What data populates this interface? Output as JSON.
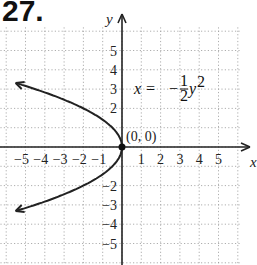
{
  "problem_number": "27.",
  "chart_data": {
    "type": "line",
    "title": "",
    "equation": "x = -½y²",
    "equation_parts": {
      "lhs": "x =",
      "sign": "−",
      "num": "1",
      "den": "2",
      "var": "y",
      "exp": "2"
    },
    "xlabel": "x",
    "ylabel": "y",
    "xlim": [
      -6,
      6
    ],
    "ylim": [
      -6,
      6
    ],
    "grid": true,
    "x_ticks": [
      "-5",
      "-4",
      "-3",
      "-2",
      "-1",
      "1",
      "2",
      "3",
      "4",
      "5"
    ],
    "y_ticks": [
      "5",
      "4",
      "3",
      "2",
      "-2",
      "-3",
      "-4",
      "-5"
    ],
    "annotations": [
      {
        "text": "(0, 0)",
        "x": 0,
        "y": 0,
        "point": true
      }
    ],
    "series": [
      {
        "name": "x = -1/2 y^2",
        "points": [
          [
            -5.5,
            3.32
          ],
          [
            -4.5,
            3
          ],
          [
            -2,
            2
          ],
          [
            -0.5,
            1
          ],
          [
            0,
            0
          ],
          [
            -0.5,
            -1
          ],
          [
            -2,
            -2
          ],
          [
            -4.5,
            -3
          ],
          [
            -5.5,
            -3.32
          ]
        ]
      }
    ]
  }
}
